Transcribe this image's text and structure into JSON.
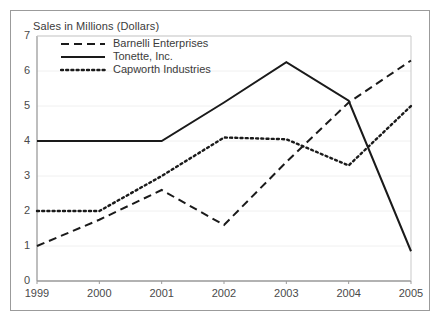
{
  "chart_data": {
    "type": "line",
    "title": "Sales in Millions (Dollars)",
    "xlabel": "",
    "ylabel": "",
    "categories": [
      "1999",
      "2000",
      "2001",
      "2002",
      "2003",
      "2004",
      "2005"
    ],
    "ylim": [
      0,
      7
    ],
    "yticks": [
      "0",
      "1",
      "2",
      "3",
      "4",
      "5",
      "6",
      "7"
    ],
    "grid": true,
    "legend_position": "top-left-inside",
    "series": [
      {
        "name": "Barnelli Enterprises",
        "style": "dashed",
        "color": "#1a1a1a",
        "values": [
          1.0,
          1.75,
          2.6,
          1.6,
          3.4,
          5.1,
          6.3
        ]
      },
      {
        "name": "Tonette, Inc.",
        "style": "solid",
        "color": "#1a1a1a",
        "values": [
          4.0,
          4.0,
          4.0,
          5.1,
          6.25,
          5.15,
          0.85
        ]
      },
      {
        "name": "Capworth Industries",
        "style": "dotted",
        "color": "#1a1a1a",
        "values": [
          2.0,
          2.0,
          3.0,
          4.1,
          4.05,
          3.3,
          5.0
        ]
      }
    ]
  },
  "legend": {
    "items": [
      {
        "label": "Barnelli Enterprises",
        "style": "dashed"
      },
      {
        "label": "Tonette, Inc.",
        "style": "solid"
      },
      {
        "label": "Capworth Industries",
        "style": "dotted"
      }
    ]
  },
  "axes": {
    "y_labels": [
      "7",
      "6",
      "5",
      "4",
      "3",
      "2",
      "1",
      "0"
    ],
    "x_labels": [
      "1999",
      "2000",
      "2001",
      "2002",
      "2003",
      "2004",
      "2005"
    ]
  }
}
